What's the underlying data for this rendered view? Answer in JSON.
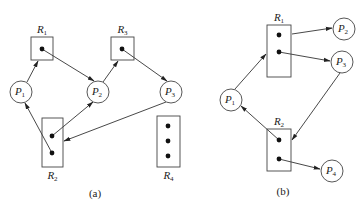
{
  "diagram_a": {
    "caption": "(a)",
    "processes": [
      {
        "id": "P1",
        "base": "P",
        "sub": "1",
        "cx": 21,
        "cy": 92
      },
      {
        "id": "P2",
        "base": "P",
        "sub": "2",
        "cx": 98,
        "cy": 92
      },
      {
        "id": "P3",
        "base": "P",
        "sub": "3",
        "cx": 171,
        "cy": 92
      }
    ],
    "resources": [
      {
        "id": "R1",
        "base": "R",
        "sub": "1",
        "x": 31,
        "y": 37,
        "w": 22,
        "h": 23,
        "label_pos": "top",
        "instances": [
          [
            42,
            49
          ]
        ]
      },
      {
        "id": "R3",
        "base": "R",
        "sub": "3",
        "x": 111,
        "y": 37,
        "w": 23,
        "h": 23,
        "label_pos": "top",
        "instances": [
          [
            122,
            49
          ]
        ]
      },
      {
        "id": "R2",
        "base": "R",
        "sub": "2",
        "x": 42,
        "y": 118,
        "w": 21,
        "h": 49,
        "label_pos": "bottom",
        "instances": [
          [
            52,
            136
          ],
          [
            52,
            153
          ]
        ]
      },
      {
        "id": "R4",
        "base": "R",
        "sub": "4",
        "x": 157,
        "y": 116,
        "w": 23,
        "h": 51,
        "label_pos": "bottom",
        "instances": [
          [
            168,
            126
          ],
          [
            168,
            141
          ],
          [
            168,
            156
          ]
        ]
      }
    ],
    "edges": [
      {
        "type": "request",
        "from": "P1",
        "to": "R1",
        "x1": 27,
        "y1": 82,
        "x2": 38,
        "y2": 61
      },
      {
        "type": "assignment",
        "from": "R1",
        "to": "P2",
        "x1": 42,
        "y1": 49,
        "x2": 94,
        "y2": 81
      },
      {
        "type": "request",
        "from": "P2",
        "to": "R3",
        "x1": 103,
        "y1": 82,
        "x2": 118,
        "y2": 61
      },
      {
        "type": "assignment",
        "from": "R3",
        "to": "P3",
        "x1": 122,
        "y1": 49,
        "x2": 167,
        "y2": 81
      },
      {
        "type": "assignment",
        "from": "R2",
        "to": "P1",
        "x1": 52,
        "y1": 153,
        "x2": 25,
        "y2": 103
      },
      {
        "type": "assignment",
        "from": "R2",
        "to": "P2",
        "x1": 52,
        "y1": 136,
        "x2": 93,
        "y2": 102
      },
      {
        "type": "request",
        "from": "P3",
        "to": "R2",
        "x1": 166,
        "y1": 102,
        "x2": 64,
        "y2": 141
      }
    ]
  },
  "diagram_b": {
    "caption": "(b)",
    "processes": [
      {
        "id": "P1",
        "base": "P",
        "sub": "1",
        "cx": 231,
        "cy": 100
      },
      {
        "id": "P2",
        "base": "P",
        "sub": "2",
        "cx": 344,
        "cy": 29
      },
      {
        "id": "P3",
        "base": "P",
        "sub": "3",
        "cx": 342,
        "cy": 62
      },
      {
        "id": "P4",
        "base": "P",
        "sub": "4",
        "cx": 332,
        "cy": 171
      }
    ],
    "resources": [
      {
        "id": "R1",
        "base": "R",
        "sub": "1",
        "x": 267,
        "y": 25,
        "w": 24,
        "h": 52,
        "label_pos": "top",
        "instances": [
          [
            279,
            35
          ],
          [
            279,
            52
          ]
        ]
      },
      {
        "id": "R2",
        "base": "R",
        "sub": "2",
        "x": 267,
        "y": 129,
        "w": 24,
        "h": 42,
        "label_pos": "top",
        "instances": [
          [
            279,
            140
          ],
          [
            279,
            159
          ]
        ]
      }
    ],
    "edges": [
      {
        "type": "request",
        "from": "P1",
        "to": "R1",
        "x1": 235,
        "y1": 89,
        "x2": 266,
        "y2": 54
      },
      {
        "type": "assignment",
        "from": "R1",
        "to": "P2",
        "x1": 292,
        "y1": 34,
        "x2": 332,
        "y2": 28
      },
      {
        "type": "assignment",
        "from": "R1",
        "to": "P3",
        "x1": 279,
        "y1": 52,
        "x2": 330,
        "y2": 61
      },
      {
        "type": "request",
        "from": "P3",
        "to": "R2",
        "x1": 340,
        "y1": 73,
        "x2": 292,
        "y2": 140
      },
      {
        "type": "assignment",
        "from": "R2",
        "to": "P1",
        "x1": 279,
        "y1": 140,
        "x2": 241,
        "y2": 106
      },
      {
        "type": "assignment",
        "from": "R2",
        "to": "P4",
        "x1": 279,
        "y1": 159,
        "x2": 320,
        "y2": 169
      }
    ]
  },
  "style": {
    "stroke": "#333333",
    "background": "#ffffff",
    "node_radius": 11
  }
}
